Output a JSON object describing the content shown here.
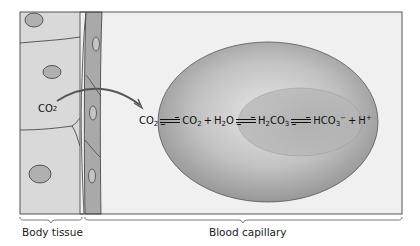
{
  "figure": {
    "co2_tissue_label": {
      "main": "CO",
      "sub": "2"
    },
    "equation": [
      {
        "main": "CO",
        "sub": "2"
      },
      {
        "arrow": "equilibrium"
      },
      {
        "main": "CO",
        "sub": "2"
      },
      {
        "plus": "+"
      },
      {
        "main": "H",
        "sub": "2",
        "tail": "O"
      },
      {
        "arrow": "equilibrium"
      },
      {
        "main": "H",
        "sub": "2",
        "tail": "CO",
        "sub2": "3"
      },
      {
        "arrow": "equilibrium"
      },
      {
        "main": "HCO",
        "sub": "3",
        "sup": "−"
      },
      {
        "plus": "+"
      },
      {
        "main": "H",
        "sup": "+"
      }
    ],
    "regions": {
      "body_tissue": "Body tissue",
      "blood_capillary": "Blood capillary"
    },
    "colors": {
      "tissue_fill": "#d6d6d6",
      "capillary_bg": "#f0f0f0",
      "wall_fill": "#a8a8a8",
      "rbc_outer": "#bdbdbd",
      "rbc_inner": "#9a9a9a",
      "outline": "#3a3a3a"
    }
  }
}
